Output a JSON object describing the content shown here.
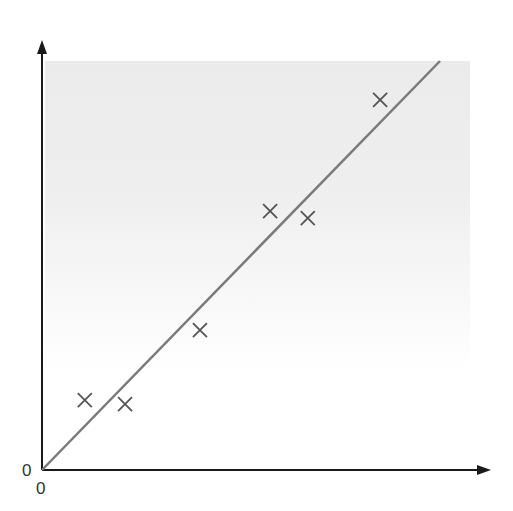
{
  "chart_data": {
    "type": "scatter",
    "title": "",
    "xlabel": "",
    "ylabel": "",
    "x_origin_label": "0",
    "y_origin_label": "0",
    "xlim": [
      0,
      10
    ],
    "ylim": [
      0,
      10
    ],
    "grid": false,
    "legend": null,
    "series": [
      {
        "name": "data points",
        "marker": "x",
        "x": [
          1.0,
          1.94,
          3.69,
          5.33,
          6.21,
          7.9
        ],
        "y": [
          1.71,
          1.61,
          3.42,
          6.33,
          6.16,
          9.05
        ]
      },
      {
        "name": "fit line",
        "type": "line",
        "x": [
          0,
          9.3
        ],
        "y": [
          0,
          10
        ]
      }
    ],
    "background": {
      "shaded_region": "gradient gray top fading to white",
      "color": "#ececec"
    }
  },
  "colors": {
    "axis": "#1a1a1a",
    "line": "#7a7a7a",
    "marker": "#555555",
    "shade": "#ebebeb"
  }
}
